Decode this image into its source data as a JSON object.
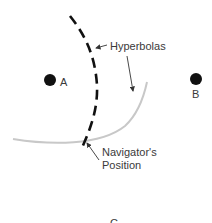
{
  "diagram": {
    "stations": [
      {
        "id": "A",
        "label": "A",
        "cx": 50,
        "cy": 80
      },
      {
        "id": "B",
        "label": "B",
        "cx": 196,
        "cy": 79
      },
      {
        "id": "C",
        "label": "C",
        "cx": 114,
        "cy": 224
      }
    ],
    "annotations": {
      "hyperbolas": "Hyperbolas",
      "navigator_line1": "Navigator's",
      "navigator_line2": "Position"
    },
    "colors": {
      "dashed_hyperbola": "#111111",
      "solid_hyperbola": "#c8c8c8",
      "text": "#3a3a3a",
      "dot": "#111111"
    }
  }
}
